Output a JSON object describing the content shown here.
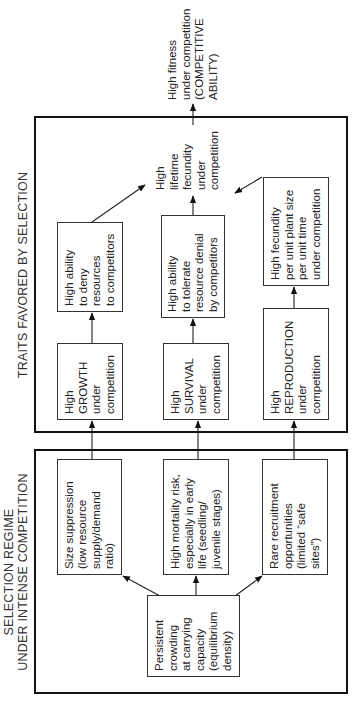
{
  "diagram": {
    "sections": {
      "selection_regime": {
        "label": "SELECTION REGIME\nUNDER INTENSE COMPETITION"
      },
      "traits": {
        "label": "TRAITS FAVORED BY SELECTION"
      }
    },
    "nodes": {
      "persistent": "Persistent\ncrowding\nat carrying\ncapacity\n(equilibrium\ndensity)",
      "size": "Size suppression\n(low resource\nsupply/demand\nratio)",
      "mortality": "High mortality risk,\nespecially in early\nlife (seedling/\njuvenile stages)",
      "rare": "Rare recruitment\nopportunities\n(limited “safe\nsites”)",
      "growth": "High\nGROWTH\nunder\ncompetition",
      "survival": "High\nSURVIVAL\nunder\ncompetition",
      "reproduction": "High\nREPRODUCTION\nunder\ncompetition",
      "deny": "High ability\nto deny\nresources\nto competitors",
      "tolerate": "High ability\nto tolerate\nresource denial\nby competitors",
      "fecundity_unit": "High fecundity\nper unit plant size\nper unit time\nunder competition",
      "lifetime": "High\nlifetime\nfecundity\nunder\ncompetition",
      "fitness": "High fitness\nunder competition\n(COMPETITIVE\nABILITY)"
    },
    "edges": [
      [
        "persistent",
        "size"
      ],
      [
        "persistent",
        "mortality"
      ],
      [
        "persistent",
        "rare"
      ],
      [
        "size",
        "growth"
      ],
      [
        "mortality",
        "survival"
      ],
      [
        "rare",
        "reproduction"
      ],
      [
        "growth",
        "deny"
      ],
      [
        "survival",
        "tolerate"
      ],
      [
        "reproduction",
        "fecundity_unit"
      ],
      [
        "deny",
        "lifetime"
      ],
      [
        "tolerate",
        "lifetime"
      ],
      [
        "fecundity_unit",
        "lifetime"
      ],
      [
        "lifetime",
        "fitness"
      ]
    ],
    "orientation": "rotated 90 degrees counter-clockwise"
  }
}
